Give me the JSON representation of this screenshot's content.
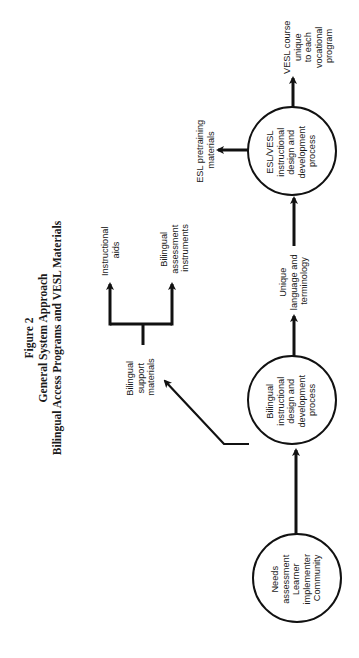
{
  "figure": {
    "number_label": "Figure 2",
    "title_line1": "General System Approach",
    "title_line2": "Bilingual Access Programs and VESL Materials",
    "orientation": "rotated-90-ccw"
  },
  "nodes": {
    "needs": {
      "shape": "circle",
      "lines": [
        "Needs",
        "assessment",
        "Learner",
        "implementer",
        "Community"
      ]
    },
    "bilingual_process": {
      "shape": "circle",
      "lines": [
        "Bilingual",
        "instructional",
        "design and",
        "development",
        "process"
      ]
    },
    "esl_process": {
      "shape": "circle",
      "lines": [
        "ESL/VESL",
        "instructional",
        "design and",
        "development",
        "process"
      ]
    },
    "bilingual_support": {
      "shape": "label",
      "lines": [
        "Bilingual",
        "support",
        "materials"
      ]
    },
    "instructional_aids": {
      "shape": "label",
      "lines": [
        "Instructional",
        "aids"
      ]
    },
    "assessment_instruments": {
      "shape": "label",
      "lines": [
        "Bilingual",
        "assessment",
        "instruments"
      ]
    },
    "unique_language": {
      "shape": "label",
      "lines": [
        "Unique",
        "language and",
        "terminology"
      ]
    },
    "esl_pretraining": {
      "shape": "label",
      "lines": [
        "ESL pretraining",
        "materials"
      ]
    },
    "vesl_course": {
      "shape": "label",
      "lines": [
        "VESL course",
        "unique",
        "to each",
        "vocational",
        "program"
      ]
    }
  },
  "edges": [
    {
      "from": "needs",
      "to": "bilingual_process"
    },
    {
      "from": "bilingual_process",
      "to": "bilingual_support"
    },
    {
      "from": "bilingual_support",
      "to": "instructional_aids"
    },
    {
      "from": "bilingual_support",
      "to": "assessment_instruments"
    },
    {
      "from": "bilingual_process",
      "to": "esl_process",
      "label": "unique_language"
    },
    {
      "from": "esl_process",
      "to": "esl_pretraining"
    },
    {
      "from": "esl_process",
      "to": "vesl_course"
    }
  ]
}
